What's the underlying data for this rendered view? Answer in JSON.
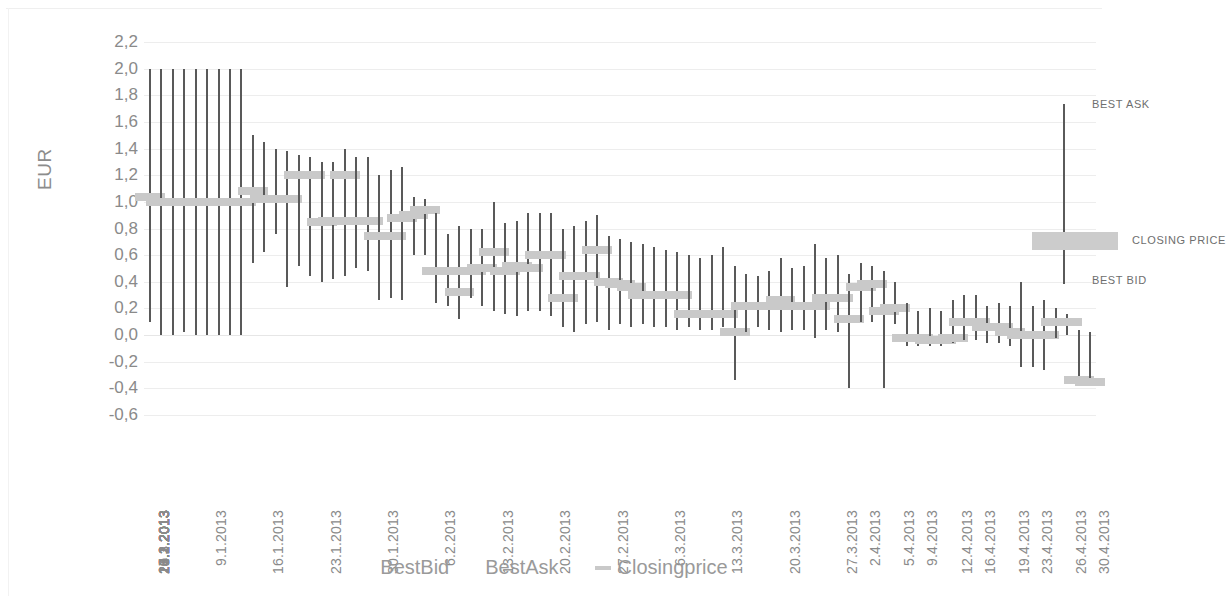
{
  "chart": {
    "y_axis_title": "EUR",
    "y_ticks": [
      "2,2",
      "2,0",
      "1,8",
      "1,6",
      "1,4",
      "1,2",
      "1,0",
      "0,8",
      "0,6",
      "0,4",
      "0,2",
      "0,0",
      "-0,2",
      "-0,4",
      "-0,6"
    ]
  },
  "legend": {
    "items": [
      {
        "label": "BestBid",
        "marker": "none"
      },
      {
        "label": "BestAsk",
        "marker": "none"
      },
      {
        "label": "Closingprice",
        "marker": "dash"
      }
    ]
  },
  "annotation": {
    "best_ask": "BEST ASK",
    "closing_price": "CLOSING PRICE",
    "best_bid": "BEST BID"
  },
  "colors": {
    "range_line": "#595959",
    "closing_bar": "#c9c9c9",
    "grid": "#ededed",
    "text": "#8a8a8a",
    "background": "#ffffff"
  },
  "chart_data": {
    "type": "bar",
    "chart_subtype": "high-low-close (OHLC range) chart",
    "title": "",
    "xlabel": "",
    "ylabel": "EUR",
    "ylim": [
      -0.6,
      2.2
    ],
    "ytick_step": 0.2,
    "grid": true,
    "legend_position": "bottom",
    "note": "High/low whisker = BestAsk / BestBid; horizontal grey bar = Closingprice. Bars reaching 2.0 are clipped by the top of the plot area.",
    "series": [
      {
        "name": "BestAsk",
        "role": "high"
      },
      {
        "name": "BestBid",
        "role": "low"
      },
      {
        "name": "Closingprice",
        "role": "close"
      }
    ],
    "categories": [
      "2.1.2013",
      "3.1.2013",
      "4.1.2013",
      "7.1.2013",
      "8.1.2013",
      "9.1.2013",
      "10.1.2013",
      "11.1.2013",
      "14.1.2013",
      "15.1.2013",
      "16.1.2013",
      "17.1.2013",
      "18.1.2013",
      "21.1.2013",
      "22.1.2013",
      "23.1.2013",
      "24.1.2013",
      "25.1.2013",
      "28.1.2013",
      "29.1.2013",
      "30.1.2013",
      "31.1.2013",
      "1.2.2013",
      "4.2.2013",
      "5.2.2013",
      "6.2.2013",
      "7.2.2013",
      "8.2.2013",
      "11.2.2013",
      "12.2.2013",
      "13.2.2013",
      "14.2.2013",
      "15.2.2013",
      "18.2.2013",
      "19.2.2013",
      "20.2.2013",
      "21.2.2013",
      "22.2.2013",
      "25.2.2013",
      "26.2.2013",
      "27.2.2013",
      "28.2.2013",
      "1.3.2013",
      "4.3.2013",
      "5.3.2013",
      "6.3.2013",
      "7.3.2013",
      "8.3.2013",
      "11.3.2013",
      "12.3.2013",
      "13.3.2013",
      "14.3.2013",
      "15.3.2013",
      "18.3.2013",
      "19.3.2013",
      "20.3.2013",
      "21.3.2013",
      "22.3.2013",
      "25.3.2013",
      "26.3.2013",
      "27.3.2013",
      "28.3.2013",
      "2.4.2013",
      "3.4.2013",
      "4.4.2013",
      "5.4.2013",
      "8.4.2013",
      "9.4.2013",
      "10.4.2013",
      "11.4.2013",
      "12.4.2013",
      "15.4.2013",
      "16.4.2013",
      "17.4.2013",
      "18.4.2013",
      "19.4.2013",
      "22.4.2013",
      "23.4.2013",
      "24.4.2013",
      "25.4.2013",
      "26.4.2013",
      "29.4.2013",
      "30.4.2013"
    ],
    "xtick_labels": [
      "2.1.2013",
      "6.1.2013",
      "9.1.2013",
      "13.1.2013",
      "16.1.2013",
      "20.1.2013",
      "23.1.2013",
      "27.1.2013",
      "30.1.2013",
      "3.2.2013",
      "6.2.2013",
      "10.2.2013",
      "13.2.2013",
      "17.2.2013",
      "20.2.2013",
      "24.2.2013",
      "27.2.2013",
      "3.3.2013",
      "6.3.2013",
      "10.3.2013",
      "13.3.2013",
      "17.3.2013",
      "20.3.2013",
      "24.3.2013",
      "27.3.2013",
      "2.4.2013",
      "5.4.2013",
      "9.4.2013",
      "12.4.2013",
      "16.4.2013",
      "19.4.2013",
      "23.4.2013",
      "26.4.2013",
      "30.4.2013"
    ],
    "bars": [
      {
        "x": "2.1.2013",
        "high": 2.0,
        "low": 0.1,
        "close": 1.04
      },
      {
        "x": "3.1.2013",
        "high": 2.0,
        "low": 0.0,
        "close": 1.0
      },
      {
        "x": "4.1.2013",
        "high": 2.0,
        "low": 0.0,
        "close": 1.0
      },
      {
        "x": "7.1.2013",
        "high": 2.0,
        "low": 0.02,
        "close": 1.0
      },
      {
        "x": "8.1.2013",
        "high": 2.0,
        "low": 0.0,
        "close": 1.0
      },
      {
        "x": "9.1.2013",
        "high": 2.0,
        "low": 0.0,
        "close": 1.0
      },
      {
        "x": "10.1.2013",
        "high": 2.0,
        "low": 0.0,
        "close": 1.0
      },
      {
        "x": "11.1.2013",
        "high": 2.0,
        "low": 0.0,
        "close": 1.0
      },
      {
        "x": "14.1.2013",
        "high": 2.0,
        "low": 0.0,
        "close": 1.0
      },
      {
        "x": "15.1.2013",
        "high": 1.5,
        "low": 0.54,
        "close": 1.08
      },
      {
        "x": "16.1.2013",
        "high": 1.45,
        "low": 0.62,
        "close": 1.02
      },
      {
        "x": "17.1.2013",
        "high": 1.4,
        "low": 0.76,
        "close": 1.02
      },
      {
        "x": "18.1.2013",
        "high": 1.38,
        "low": 0.36,
        "close": 1.02
      },
      {
        "x": "21.1.2013",
        "high": 1.35,
        "low": 0.52,
        "close": 1.2
      },
      {
        "x": "22.1.2013",
        "high": 1.34,
        "low": 0.44,
        "close": 1.2
      },
      {
        "x": "23.1.2013",
        "high": 1.3,
        "low": 0.4,
        "close": 0.85
      },
      {
        "x": "24.1.2013",
        "high": 1.3,
        "low": 0.42,
        "close": 0.86
      },
      {
        "x": "25.1.2013",
        "high": 1.4,
        "low": 0.44,
        "close": 1.2
      },
      {
        "x": "28.1.2013",
        "high": 1.34,
        "low": 0.5,
        "close": 0.86
      },
      {
        "x": "29.1.2013",
        "high": 1.34,
        "low": 0.48,
        "close": 0.86
      },
      {
        "x": "30.1.2013",
        "high": 1.2,
        "low": 0.26,
        "close": 0.74
      },
      {
        "x": "31.1.2013",
        "high": 1.24,
        "low": 0.28,
        "close": 0.74
      },
      {
        "x": "1.2.2013",
        "high": 1.26,
        "low": 0.26,
        "close": 0.88
      },
      {
        "x": "4.2.2013",
        "high": 1.04,
        "low": 0.6,
        "close": 0.9
      },
      {
        "x": "5.2.2013",
        "high": 1.02,
        "low": 0.6,
        "close": 0.94
      },
      {
        "x": "6.2.2013",
        "high": 0.92,
        "low": 0.24,
        "close": 0.48
      },
      {
        "x": "7.2.2013",
        "high": 0.76,
        "low": 0.22,
        "close": 0.48
      },
      {
        "x": "8.2.2013",
        "high": 0.82,
        "low": 0.12,
        "close": 0.32
      },
      {
        "x": "11.2.2013",
        "high": 0.8,
        "low": 0.28,
        "close": 0.48
      },
      {
        "x": "12.2.2013",
        "high": 0.8,
        "low": 0.22,
        "close": 0.5
      },
      {
        "x": "13.2.2013",
        "high": 1.0,
        "low": 0.18,
        "close": 0.62
      },
      {
        "x": "14.2.2013",
        "high": 0.84,
        "low": 0.16,
        "close": 0.48
      },
      {
        "x": "15.2.2013",
        "high": 0.86,
        "low": 0.14,
        "close": 0.52
      },
      {
        "x": "18.2.2013",
        "high": 0.92,
        "low": 0.18,
        "close": 0.5
      },
      {
        "x": "19.2.2013",
        "high": 0.92,
        "low": 0.18,
        "close": 0.6
      },
      {
        "x": "20.2.2013",
        "high": 0.92,
        "low": 0.14,
        "close": 0.6
      },
      {
        "x": "21.2.2013",
        "high": 0.8,
        "low": 0.06,
        "close": 0.28
      },
      {
        "x": "22.2.2013",
        "high": 0.82,
        "low": 0.02,
        "close": 0.44
      },
      {
        "x": "25.2.2013",
        "high": 0.86,
        "low": 0.08,
        "close": 0.44
      },
      {
        "x": "26.2.2013",
        "high": 0.9,
        "low": 0.1,
        "close": 0.64
      },
      {
        "x": "27.2.2013",
        "high": 0.74,
        "low": 0.04,
        "close": 0.4
      },
      {
        "x": "28.2.2013",
        "high": 0.72,
        "low": 0.08,
        "close": 0.38
      },
      {
        "x": "1.3.2013",
        "high": 0.7,
        "low": 0.06,
        "close": 0.36
      },
      {
        "x": "4.3.2013",
        "high": 0.68,
        "low": 0.08,
        "close": 0.3
      },
      {
        "x": "5.3.2013",
        "high": 0.66,
        "low": 0.06,
        "close": 0.3
      },
      {
        "x": "6.3.2013",
        "high": 0.64,
        "low": 0.06,
        "close": 0.3
      },
      {
        "x": "7.3.2013",
        "high": 0.62,
        "low": 0.04,
        "close": 0.3
      },
      {
        "x": "8.3.2013",
        "high": 0.6,
        "low": 0.06,
        "close": 0.16
      },
      {
        "x": "11.3.2013",
        "high": 0.58,
        "low": 0.04,
        "close": 0.16
      },
      {
        "x": "12.3.2013",
        "high": 0.6,
        "low": 0.04,
        "close": 0.16
      },
      {
        "x": "13.3.2013",
        "high": 0.66,
        "low": 0.06,
        "close": 0.16
      },
      {
        "x": "14.3.2013",
        "high": 0.52,
        "low": -0.34,
        "close": 0.02
      },
      {
        "x": "15.3.2013",
        "high": 0.46,
        "low": 0.02,
        "close": 0.22
      },
      {
        "x": "18.3.2013",
        "high": 0.44,
        "low": 0.06,
        "close": 0.22
      },
      {
        "x": "19.3.2013",
        "high": 0.48,
        "low": 0.04,
        "close": 0.22
      },
      {
        "x": "20.3.2013",
        "high": 0.58,
        "low": 0.02,
        "close": 0.26
      },
      {
        "x": "21.3.2013",
        "high": 0.5,
        "low": 0.04,
        "close": 0.22
      },
      {
        "x": "22.3.2013",
        "high": 0.52,
        "low": 0.04,
        "close": 0.22
      },
      {
        "x": "25.3.2013",
        "high": 0.68,
        "low": -0.02,
        "close": 0.22
      },
      {
        "x": "26.3.2013",
        "high": 0.58,
        "low": 0.04,
        "close": 0.28
      },
      {
        "x": "27.3.2013",
        "high": 0.6,
        "low": 0.02,
        "close": 0.28
      },
      {
        "x": "28.3.2013",
        "high": 0.46,
        "low": -0.4,
        "close": 0.12
      },
      {
        "x": "2.4.2013",
        "high": 0.54,
        "low": 0.1,
        "close": 0.36
      },
      {
        "x": "3.4.2013",
        "high": 0.52,
        "low": 0.1,
        "close": 0.38
      },
      {
        "x": "4.4.2013",
        "high": 0.48,
        "low": -0.4,
        "close": 0.18
      },
      {
        "x": "5.4.2013",
        "high": 0.4,
        "low": 0.08,
        "close": 0.2
      },
      {
        "x": "8.4.2013",
        "high": 0.24,
        "low": -0.08,
        "close": -0.02
      },
      {
        "x": "9.4.2013",
        "high": 0.18,
        "low": -0.08,
        "close": -0.02
      },
      {
        "x": "10.4.2013",
        "high": 0.2,
        "low": -0.08,
        "close": -0.04
      },
      {
        "x": "11.4.2013",
        "high": 0.18,
        "low": -0.08,
        "close": -0.04
      },
      {
        "x": "12.4.2013",
        "high": 0.26,
        "low": -0.06,
        "close": -0.02
      },
      {
        "x": "15.4.2013",
        "high": 0.3,
        "low": -0.04,
        "close": 0.1
      },
      {
        "x": "16.4.2013",
        "high": 0.3,
        "low": -0.04,
        "close": 0.1
      },
      {
        "x": "17.4.2013",
        "high": 0.22,
        "low": -0.06,
        "close": 0.06
      },
      {
        "x": "18.4.2013",
        "high": 0.24,
        "low": -0.06,
        "close": 0.06
      },
      {
        "x": "19.4.2013",
        "high": 0.22,
        "low": -0.08,
        "close": 0.02
      },
      {
        "x": "22.4.2013",
        "high": 0.4,
        "low": -0.24,
        "close": 0.0
      },
      {
        "x": "23.4.2013",
        "high": 0.22,
        "low": -0.24,
        "close": 0.0
      },
      {
        "x": "24.4.2013",
        "high": 0.26,
        "low": -0.26,
        "close": 0.0
      },
      {
        "x": "25.4.2013",
        "high": 0.2,
        "low": -0.02,
        "close": 0.1
      },
      {
        "x": "26.4.2013",
        "high": 0.16,
        "low": 0.0,
        "close": 0.1
      },
      {
        "x": "29.4.2013",
        "high": 0.04,
        "low": -0.34,
        "close": -0.34
      },
      {
        "x": "30.4.2013",
        "high": 0.02,
        "low": -0.36,
        "close": -0.35
      }
    ]
  }
}
